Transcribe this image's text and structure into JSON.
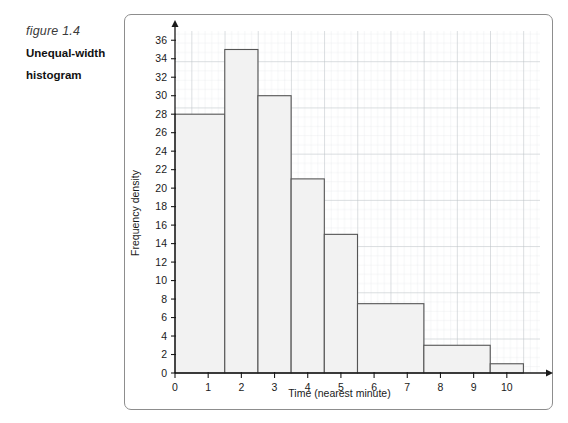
{
  "caption": {
    "figure_number": "figure 1.4",
    "title_line1": "Unequal-width",
    "title_line2": "histogram"
  },
  "colors": {
    "frame_border": "#8d8d8d",
    "axis": "#1a1a1a",
    "bar_fill": "#f2f2f2",
    "bar_stroke": "#555555",
    "grid_minor": "#d9dde0",
    "grid_major": "#b9bfc4",
    "text": "#1a1a1a"
  },
  "chart_data": {
    "type": "bar",
    "title": "",
    "xlabel": "Time (nearest minute)",
    "ylabel": "Frequency density",
    "xlim": [
      0,
      11
    ],
    "ylim": [
      0,
      37
    ],
    "xticks": [
      "0",
      "1",
      "2",
      "3",
      "4",
      "5",
      "6",
      "7",
      "8",
      "9",
      "10"
    ],
    "xtick_values": [
      0,
      1,
      2,
      3,
      4,
      5,
      6,
      7,
      8,
      9,
      10
    ],
    "yticks": [
      "0",
      "2",
      "4",
      "6",
      "8",
      "10",
      "12",
      "14",
      "16",
      "18",
      "20",
      "22",
      "24",
      "26",
      "28",
      "30",
      "32",
      "34",
      "36"
    ],
    "ytick_values": [
      0,
      2,
      4,
      6,
      8,
      10,
      12,
      14,
      16,
      18,
      20,
      22,
      24,
      26,
      28,
      30,
      32,
      34,
      36
    ],
    "grid": true,
    "legend": "none",
    "bins": [
      {
        "label": "0 - 1.5",
        "start": 0.0,
        "end": 1.5,
        "value": 28
      },
      {
        "label": "1.5 - 2.5",
        "start": 1.5,
        "end": 2.5,
        "value": 35
      },
      {
        "label": "2.5 - 3.5",
        "start": 2.5,
        "end": 3.5,
        "value": 30
      },
      {
        "label": "3.5 - 4.5",
        "start": 3.5,
        "end": 4.5,
        "value": 21
      },
      {
        "label": "4.5 - 5.5",
        "start": 4.5,
        "end": 5.5,
        "value": 15
      },
      {
        "label": "5.5 - 7.5",
        "start": 5.5,
        "end": 7.5,
        "value": 7.5
      },
      {
        "label": "7.5 - 9.5",
        "start": 7.5,
        "end": 9.5,
        "value": 3
      },
      {
        "label": "9.5 - 10.5",
        "start": 9.5,
        "end": 10.5,
        "value": 1
      }
    ]
  }
}
